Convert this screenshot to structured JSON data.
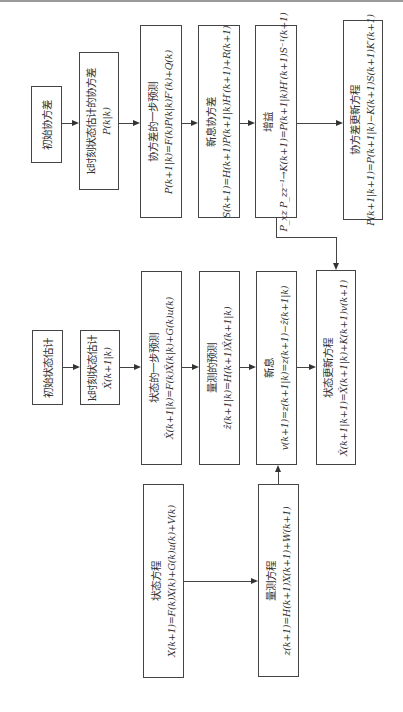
{
  "diagram": {
    "covariance_row": {
      "initial_covariance": {
        "title": "初始协方差"
      },
      "k_covariance": {
        "title": "k时刻状态估计的协方差",
        "formula": "P(k|k)"
      },
      "covariance_prediction": {
        "title": "协方差的一步预测",
        "formula": "P(k+1|k)=F(k)P(k|k)F′(k)+Q(k)"
      },
      "innovation_covariance": {
        "title": "新息协方差",
        "formula": "S(k+1)=H(k+1)P(k+1|k)H′(k+1)+R(k+1)"
      },
      "gain": {
        "title": "增益",
        "formula": "P_xz P_zz⁻¹→K(k+1)=P(k+1|k)H′(k+1)S⁻¹(k+1)"
      },
      "covariance_update": {
        "title": "协方差更新方程",
        "formula": "P(k+1|k+1)=P(k+1|k)−K(k+1)S(k+1)K′(k+1)"
      }
    },
    "state_row": {
      "initial_state": {
        "title": "初始状态估计"
      },
      "k_state": {
        "title": "k时刻状态估计",
        "formula": "X̂(k+1|k)"
      },
      "state_prediction": {
        "title": "状态的一步预测",
        "formula": "X̂(k+1|k)=F(k)X̂(k|k)+G(k)u(k)"
      },
      "measurement_prediction": {
        "title": "量测的预测",
        "formula": "ẑ(k+1|k)=H(k+1)X̂(k+1|k)"
      },
      "innovation": {
        "title": "新息",
        "formula": "v(k+1)=z(k+1|k)=z(k+1)−ẑ(k+1|k)"
      },
      "state_update": {
        "title": "状态更新方程",
        "formula": "X̂(k+1|k+1)=X̂(k+1|k)+K(k+1)v(k+1)"
      }
    },
    "model_row": {
      "state_equation": {
        "title": "状态方程",
        "formula": "X(k+1)=F(k)X(k)+G(k)u(k)+V(k)"
      },
      "measurement_equation": {
        "title": "量测方程",
        "formula": "z(k+1)=H(k+1)X(k+1)+W(k+1)"
      }
    },
    "colors": {
      "line": "#444444",
      "background": "#ffffff",
      "text": "#333333"
    }
  }
}
